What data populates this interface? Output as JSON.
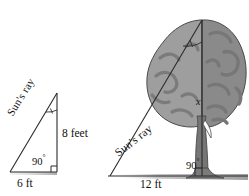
{
  "figure": {
    "background_color": "#ffffff",
    "line_color": "#2b2b2b",
    "canopy_light_color": "#9d9d9d",
    "canopy_dark_color": "#8a8a8a",
    "canopy_detail_color": "#7a7a7a",
    "trunk_color": "#6f6f6f",
    "ground_shadow_color": "#b9b9b9"
  },
  "left_triangle": {
    "name": "stick-shadow-triangle",
    "hypotenuse_label": "Sun's ray",
    "vertical_label": "8 feet",
    "right_angle_label": "90",
    "right_angle_degree_symbol": "°",
    "base_label": "6 ft",
    "vertices": {
      "apex": [
        57,
        93
      ],
      "corner": [
        57,
        172
      ],
      "foot": [
        10,
        172
      ]
    }
  },
  "right_triangle": {
    "name": "tree-shadow-triangle",
    "hypotenuse_label": "Sun's ray",
    "vertical_label": "x",
    "right_angle_label": "90",
    "right_angle_degree_symbol": "°",
    "base_label": "12 ft",
    "vertices": {
      "apex": [
        202,
        20
      ],
      "corner": [
        202,
        176
      ],
      "foot": [
        110,
        176
      ]
    }
  },
  "icons": {
    "tree": "tree-illustration",
    "angle_arc": "angle-arc-marker",
    "right_angle_square": "right-angle-square-marker"
  }
}
